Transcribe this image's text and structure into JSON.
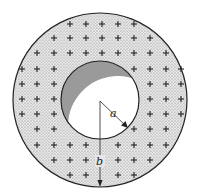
{
  "figure": {
    "center": [
      100,
      100
    ],
    "outer_radius_px": 87,
    "inner_radius_px": 39,
    "colors": {
      "shell_fill": "#d9d9d9",
      "cavity_shade": "#9a9a9a",
      "cavity_light": "#ffffff",
      "outline": "#222222"
    },
    "labels": {
      "inner_radius": "a",
      "outer_radius": "b"
    },
    "charge_symbol": "+",
    "charges": [
      [
        70,
        24
      ],
      [
        86,
        24
      ],
      [
        102,
        24
      ],
      [
        118,
        24
      ],
      [
        134,
        24
      ],
      [
        54,
        38
      ],
      [
        70,
        38
      ],
      [
        86,
        38
      ],
      [
        102,
        38
      ],
      [
        118,
        38
      ],
      [
        134,
        38
      ],
      [
        150,
        38
      ],
      [
        37,
        53
      ],
      [
        54,
        53
      ],
      [
        70,
        53
      ],
      [
        86,
        53
      ],
      [
        102,
        53
      ],
      [
        118,
        53
      ],
      [
        134,
        53
      ],
      [
        150,
        53
      ],
      [
        166,
        53
      ],
      [
        22,
        69
      ],
      [
        37,
        69
      ],
      [
        54,
        69
      ],
      [
        134,
        69
      ],
      [
        150,
        69
      ],
      [
        166,
        69
      ],
      [
        181,
        69
      ],
      [
        22,
        84
      ],
      [
        37,
        84
      ],
      [
        54,
        84
      ],
      [
        150,
        84
      ],
      [
        166,
        84
      ],
      [
        181,
        84
      ],
      [
        22,
        99
      ],
      [
        37,
        99
      ],
      [
        54,
        99
      ],
      [
        150,
        99
      ],
      [
        166,
        99
      ],
      [
        181,
        99
      ],
      [
        22,
        114
      ],
      [
        37,
        114
      ],
      [
        54,
        114
      ],
      [
        150,
        114
      ],
      [
        166,
        114
      ],
      [
        181,
        114
      ],
      [
        37,
        129
      ],
      [
        54,
        129
      ],
      [
        134,
        129
      ],
      [
        150,
        129
      ],
      [
        166,
        129
      ],
      [
        37,
        145
      ],
      [
        54,
        145
      ],
      [
        70,
        145
      ],
      [
        86,
        145
      ],
      [
        118,
        145
      ],
      [
        134,
        145
      ],
      [
        150,
        145
      ],
      [
        166,
        145
      ],
      [
        54,
        160
      ],
      [
        70,
        160
      ],
      [
        86,
        160
      ],
      [
        118,
        160
      ],
      [
        134,
        160
      ],
      [
        150,
        160
      ],
      [
        70,
        175
      ],
      [
        86,
        175
      ],
      [
        118,
        175
      ],
      [
        134,
        175
      ]
    ]
  }
}
